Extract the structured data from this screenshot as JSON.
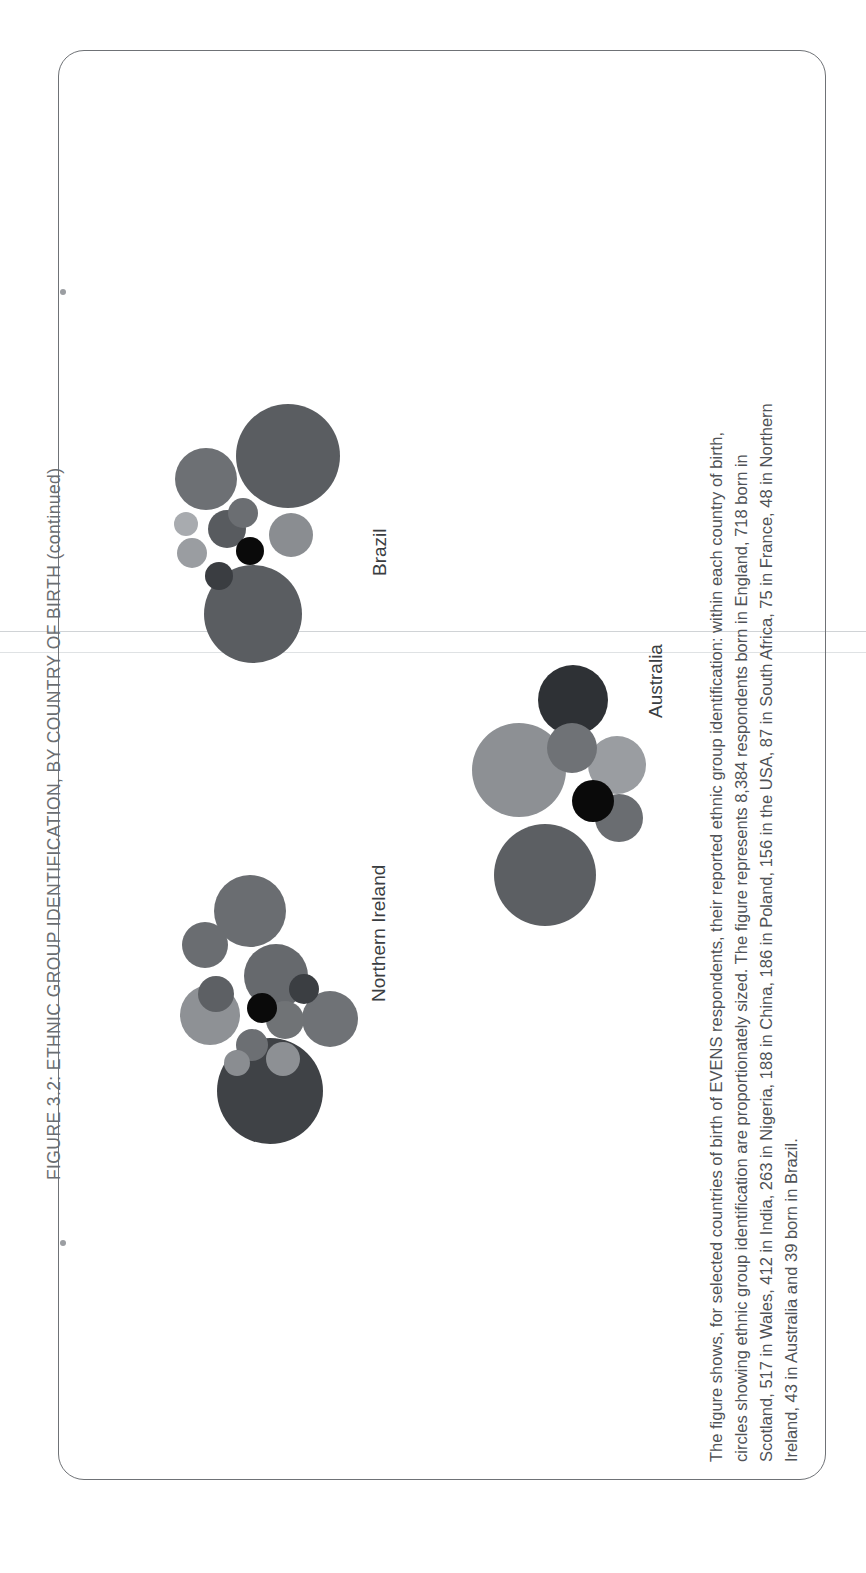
{
  "page": {
    "orientation": "rotated-90-ccw",
    "background": "#ffffff",
    "border_color": "#6f7276"
  },
  "figure": {
    "title": "FIGURE 3.2: ETHNIC GROUP IDENTIFICATION, BY COUNTRY OF BIRTH  (continued)",
    "title_color": "#6b6e72",
    "caption_lines": [
      "The figure shows, for selected countries of birth of EVENS respondents, their reported ethnic group identification: within each country of birth,",
      "circles showing ethnic group identification are proportionately sized. The figure represents 8,384 respondents born in England, 718 born in",
      "Scotland, 517 in Wales, 412 in India, 263 in Nigeria, 188 in China, 186 in Poland, 156 in the USA, 87 in South Africa, 75 in France, 48 in Northern",
      "Ireland, 43 in Australia and 39 born in Brazil."
    ],
    "caption_color": "#4f5256"
  },
  "chart_data": {
    "type": "bubble",
    "title": "FIGURE 3.2: ETHNIC GROUP IDENTIFICATION, BY COUNTRY OF BIRTH (continued)",
    "xlabel": "",
    "ylabel": "",
    "grid": false,
    "legend_position": "none",
    "note": "Circle-packing chart: one packed cluster of proportionately sized circles per country of birth; circle area is proportional to the number of respondents reporting each ethnic group.",
    "clusters": [
      {
        "label": "Brazil",
        "total_respondents": 39,
        "circles": [
          {
            "shade": "#5a5d61",
            "r": 52
          },
          {
            "shade": "#5a5d61",
            "r": 49
          },
          {
            "shade": "#6d7074",
            "r": 31
          },
          {
            "shade": "#8a8d91",
            "r": 22
          },
          {
            "shade": "#585b5f",
            "r": 19
          },
          {
            "shade": "#9a9da1",
            "r": 15
          },
          {
            "shade": "#6b6e72",
            "r": 15
          },
          {
            "shade": "#0a0a0a",
            "r": 14
          },
          {
            "shade": "#3a3d41",
            "r": 14
          },
          {
            "shade": "#a8abaf",
            "r": 12
          }
        ]
      },
      {
        "label": "Northern Ireland",
        "total_respondents": 48,
        "circles": [
          {
            "shade": "#3f4246",
            "r": 53
          },
          {
            "shade": "#6a6d71",
            "r": 36
          },
          {
            "shade": "#66696d",
            "r": 32
          },
          {
            "shade": "#8e9195",
            "r": 30
          },
          {
            "shade": "#6f7276",
            "r": 28
          },
          {
            "shade": "#6a6d71",
            "r": 23
          },
          {
            "shade": "#707376",
            "r": 19
          },
          {
            "shade": "#5d6064",
            "r": 18
          },
          {
            "shade": "#8d9094",
            "r": 17
          },
          {
            "shade": "#6c6f73",
            "r": 16
          },
          {
            "shade": "#3b3e42",
            "r": 15
          },
          {
            "shade": "#0a0a0a",
            "r": 15
          },
          {
            "shade": "#8a8d91",
            "r": 13
          }
        ]
      },
      {
        "label": "Australia",
        "total_respondents": 43,
        "circles": [
          {
            "shade": "#5c5f63",
            "r": 51
          },
          {
            "shade": "#8d9094",
            "r": 47
          },
          {
            "shade": "#2e3135",
            "r": 35
          },
          {
            "shade": "#9a9da1",
            "r": 29
          },
          {
            "shade": "#6f7276",
            "r": 25
          },
          {
            "shade": "#6a6d71",
            "r": 24
          },
          {
            "shade": "#0a0a0a",
            "r": 21
          }
        ]
      }
    ]
  }
}
